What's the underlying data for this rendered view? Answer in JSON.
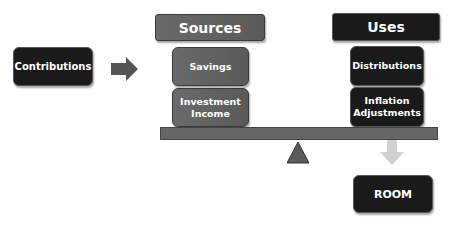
{
  "left": {
    "contributions": "Contributions"
  },
  "sources": {
    "header": "Sources",
    "items": [
      "Savings",
      "Investment Income"
    ]
  },
  "uses": {
    "header": "Uses",
    "items": [
      "Distributions",
      "Inflation Adjustments"
    ]
  },
  "result": {
    "label": "ROOM"
  },
  "colors": {
    "dark": "#1a1a1a",
    "gray": "#5f5f5f",
    "arrow_light": "#d0d0d0"
  }
}
